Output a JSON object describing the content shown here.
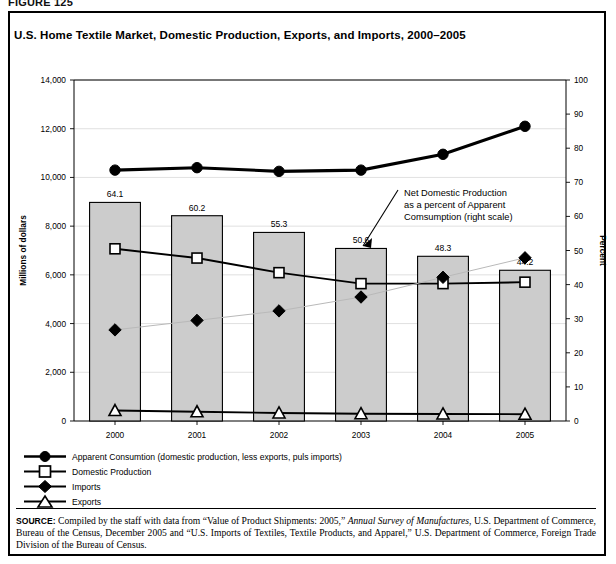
{
  "figure": {
    "label": "FIGURE 125",
    "title": "U.S. Home Textile Market, Domestic Production, Exports, and Imports, 2000–2005"
  },
  "source": {
    "head": "SOURCE:",
    "part1": " Compiled by the staff with data from “Value of Product Shipments: 2005,” ",
    "italic1": "Annual Survey of Manufactures",
    "part2": ", U.S. Department of Commerce, Bureau of the Census, December 2005 and “U.S. Imports of Textiles, Textile Products, and Apparel,” U.S. Department of Commerce, Foreign Trade Division of the Bureau of Census."
  },
  "legend": {
    "items": [
      {
        "key": "circle-filled",
        "label": "Apparent Consumtion (domestic production, less exports, puls imports)"
      },
      {
        "key": "square-open",
        "label": "Domestic Production"
      },
      {
        "key": "diamond-filled",
        "label": "Imports"
      },
      {
        "key": "triangle-open",
        "label": "Exports"
      }
    ]
  },
  "annotation": {
    "line1": "Net Domestic Production",
    "line2": "as a percent of Apparent",
    "line3": "Comsumption (right scale)"
  },
  "chart_data": {
    "type": "bar",
    "title": "U.S. Home Textile Market, Domestic Production, Exports, and Imports, 2000–2005",
    "xlabel": "",
    "ylabel": "Millions of dollars",
    "y2label": "Percent",
    "categories": [
      "2000",
      "2001",
      "2002",
      "2003",
      "2004",
      "2005"
    ],
    "ylim": [
      0,
      14000
    ],
    "yticks": [
      0,
      2000,
      4000,
      6000,
      8000,
      10000,
      12000,
      14000
    ],
    "ytick_labels": [
      "0",
      "2,000",
      "4,000",
      "6,000",
      "8,000",
      "10,000",
      "12,000",
      "14,000"
    ],
    "y2lim": [
      0,
      100
    ],
    "y2ticks": [
      0,
      10,
      20,
      30,
      40,
      50,
      60,
      70,
      80,
      90,
      100
    ],
    "y2tick_labels": [
      "0",
      "10",
      "20",
      "30",
      "40",
      "50",
      "60",
      "70",
      "80",
      "90",
      "100"
    ],
    "grid": true,
    "legend_position": "below-plot",
    "bars": {
      "name": "Net Domestic Production as a percent of Apparent Comsumption (right scale)",
      "axis": "right",
      "values": [
        64.1,
        60.2,
        55.3,
        50.6,
        48.3,
        44.2
      ],
      "data_labels": [
        "64.1",
        "60.2",
        "55.3",
        "50.6",
        "48.3",
        "44.2"
      ]
    },
    "series": [
      {
        "name": "Apparent Consumtion (domestic production, less exports, puls imports)",
        "marker": "circle-filled",
        "axis": "left",
        "values": [
          10300,
          10400,
          10250,
          10300,
          10950,
          12100
        ]
      },
      {
        "name": "Domestic Production",
        "marker": "square-open",
        "axis": "left",
        "values": [
          7070,
          6690,
          6090,
          5640,
          5640,
          5700
        ]
      },
      {
        "name": "Imports",
        "marker": "diamond-filled",
        "axis": "left",
        "values": [
          3740,
          4130,
          4520,
          5090,
          5900,
          6700
        ]
      },
      {
        "name": "Exports",
        "marker": "triangle-open",
        "axis": "left",
        "values": [
          430,
          380,
          330,
          300,
          290,
          280
        ]
      }
    ]
  }
}
